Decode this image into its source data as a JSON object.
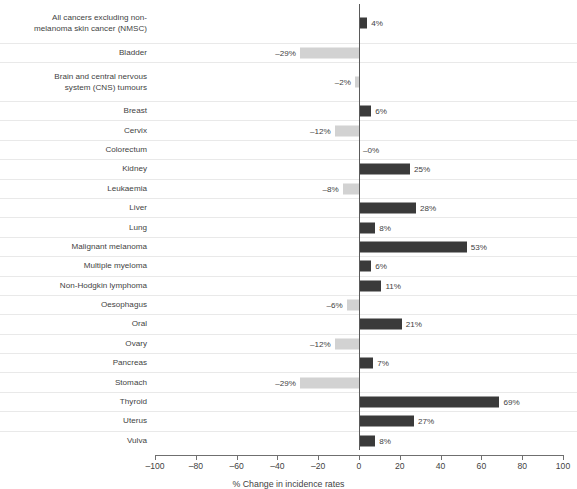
{
  "chart_data": {
    "type": "bar",
    "orientation": "horizontal",
    "title": "",
    "xlabel": "% Change in incidence rates",
    "ylabel": "",
    "xlim": [
      -100,
      100
    ],
    "xticks": [
      -100,
      -80,
      -60,
      -40,
      -20,
      0,
      20,
      40,
      60,
      80,
      100
    ],
    "xtick_labels": [
      "-100",
      "-80",
      "-60",
      "-40",
      "-20",
      "0",
      "20",
      "40",
      "60",
      "80",
      "100"
    ],
    "grid": true,
    "legend": "none",
    "colors": {
      "positive_bar": "#3a3a3a",
      "negative_bar": "#d2d2d2",
      "gridline": "#e9e9e9",
      "axis": "#6f6f6f",
      "text": "#3f3f3f"
    },
    "categories": [
      "All cancers excluding non-\nmelanoma skin cancer (NMSC)",
      "Bladder",
      "Brain and central nervous\nsystem (CNS) tumours",
      "Breast",
      "Cervix",
      "Colorectum",
      "Kidney",
      "Leukaemia",
      "Liver",
      "Lung",
      "Malignant melanoma",
      "Multiple myeloma",
      "Non-Hodgkin lymphoma",
      "Oesophagus",
      "Oral",
      "Ovary",
      "Pancreas",
      "Stomach",
      "Thyroid",
      "Uterus",
      "Vulva"
    ],
    "values": [
      4,
      -29,
      -2,
      6,
      -12,
      0,
      25,
      -8,
      28,
      8,
      53,
      6,
      11,
      -6,
      21,
      -12,
      7,
      -29,
      69,
      27,
      8
    ],
    "value_labels": [
      "4%",
      "-29%",
      "-2%",
      "6%",
      "-12%",
      "-0%",
      "25%",
      "-8%",
      "28%",
      "8%",
      "53%",
      "6%",
      "11%",
      "-6%",
      "21%",
      "-12%",
      "7%",
      "-29%",
      "69%",
      "27%",
      "8%"
    ]
  }
}
